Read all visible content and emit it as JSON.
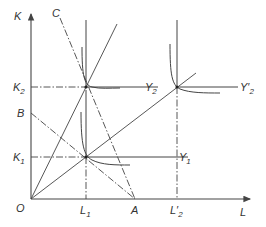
{
  "diagram": {
    "axes": {
      "y_label": "K",
      "x_label": "L",
      "origin_label": "O"
    },
    "y_ticks": [
      {
        "main": "K",
        "sub": "2"
      },
      {
        "main": "B",
        "sub": ""
      },
      {
        "main": "K",
        "sub": "1"
      }
    ],
    "x_ticks": [
      {
        "main": "L",
        "sub": "1"
      },
      {
        "main": "A",
        "sub": ""
      },
      {
        "main": "L′",
        "sub": "2"
      }
    ],
    "points": {
      "C": "C",
      "Y1": {
        "main": "Y",
        "sub": "1"
      },
      "Y2": {
        "main": "Y",
        "sub": "2"
      },
      "Y2prime": {
        "main": "Y′",
        "sub": "2"
      }
    },
    "colors": {
      "line": "#444444",
      "background": "#ffffff"
    }
  }
}
